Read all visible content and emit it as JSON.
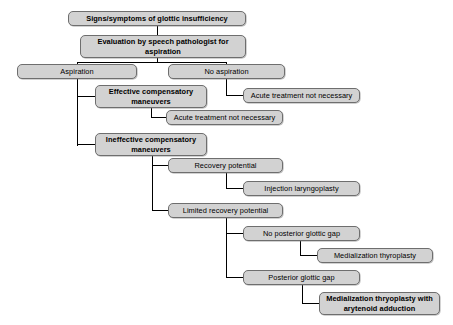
{
  "diagram": {
    "type": "flowchart",
    "background_color": "#ffffff",
    "node_fill_color": "#d2d2d2",
    "node_border_color": "#6e6e6e",
    "connector_color": "#000000",
    "nodes": [
      {
        "id": "signs",
        "label": "Signs/symptoms of glottic insufficiency",
        "bold": true,
        "x": 68,
        "y": 11,
        "w": 178,
        "h": 15
      },
      {
        "id": "evaluation",
        "label": "Evaluation by speech pathologist for aspiration",
        "bold": true,
        "x": 80,
        "y": 35,
        "w": 166,
        "h": 23
      },
      {
        "id": "aspiration",
        "label": "Aspiration",
        "bold": false,
        "x": 17,
        "y": 64,
        "w": 120,
        "h": 15
      },
      {
        "id": "noaspiration",
        "label": "No aspiration",
        "bold": false,
        "x": 168,
        "y": 64,
        "w": 117,
        "h": 15
      },
      {
        "id": "acute1",
        "label": "Acute treatment not necessary",
        "bold": false,
        "x": 243,
        "y": 88,
        "w": 117,
        "h": 15
      },
      {
        "id": "effective",
        "label": "Effective compensatory maneuvers",
        "bold": true,
        "x": 95,
        "y": 85,
        "w": 112,
        "h": 23
      },
      {
        "id": "acute2",
        "label": "Acute treatment not necessary",
        "bold": false,
        "x": 166,
        "y": 110,
        "w": 117,
        "h": 15
      },
      {
        "id": "ineffective",
        "label": "Ineffective compensatory maneuvers",
        "bold": true,
        "x": 95,
        "y": 133,
        "w": 112,
        "h": 23
      },
      {
        "id": "recovery",
        "label": "Recovery potential",
        "bold": false,
        "x": 168,
        "y": 158,
        "w": 115,
        "h": 15
      },
      {
        "id": "injection",
        "label": "Injection laryngoplasty",
        "bold": false,
        "x": 243,
        "y": 181,
        "w": 117,
        "h": 15
      },
      {
        "id": "limited",
        "label": "Limited recovery potential",
        "bold": false,
        "x": 168,
        "y": 203,
        "w": 115,
        "h": 15
      },
      {
        "id": "noposterior",
        "label": "No posterior glottic gap",
        "bold": false,
        "x": 243,
        "y": 226,
        "w": 117,
        "h": 15
      },
      {
        "id": "medthyro",
        "label": "Medialization thyroplasty",
        "bold": false,
        "x": 317,
        "y": 248,
        "w": 116,
        "h": 15
      },
      {
        "id": "posterior",
        "label": "Posterior glottic gap",
        "bold": false,
        "x": 243,
        "y": 270,
        "w": 117,
        "h": 15
      },
      {
        "id": "medthyroaryt",
        "label": "Medialization thryoplasty with arytenoid adduction",
        "bold": true,
        "x": 319,
        "y": 292,
        "w": 121,
        "h": 23
      }
    ],
    "connectors": [
      {
        "from": "signs",
        "to": "evaluation",
        "style": "vertical"
      },
      {
        "from": "evaluation",
        "to": "aspiration",
        "style": "split-left"
      },
      {
        "from": "evaluation",
        "to": "noaspiration",
        "style": "split-right"
      },
      {
        "from": "noaspiration",
        "to": "acute1",
        "style": "elbow"
      },
      {
        "from": "aspiration",
        "to": "effective",
        "style": "elbow"
      },
      {
        "from": "aspiration",
        "to": "ineffective",
        "style": "elbow"
      },
      {
        "from": "effective",
        "to": "acute2",
        "style": "elbow"
      },
      {
        "from": "ineffective",
        "to": "recovery",
        "style": "elbow"
      },
      {
        "from": "ineffective",
        "to": "limited",
        "style": "elbow"
      },
      {
        "from": "recovery",
        "to": "injection",
        "style": "elbow"
      },
      {
        "from": "limited",
        "to": "noposterior",
        "style": "elbow"
      },
      {
        "from": "limited",
        "to": "posterior",
        "style": "elbow"
      },
      {
        "from": "noposterior",
        "to": "medthyro",
        "style": "elbow"
      },
      {
        "from": "posterior",
        "to": "medthyroaryt",
        "style": "elbow"
      }
    ],
    "edge_segments": [
      {
        "name": "signs-to-evaluation",
        "orient": "v",
        "x": 157,
        "y": 26,
        "len": 9
      },
      {
        "name": "evaluation-down-stub",
        "orient": "v",
        "x": 157,
        "y": 58,
        "len": 5
      },
      {
        "name": "evaluation-split-bar",
        "orient": "h",
        "x": 77,
        "y": 62,
        "len": 150
      },
      {
        "name": "split-drop-aspiration",
        "orient": "v",
        "x": 77,
        "y": 62,
        "len": 3
      },
      {
        "name": "split-drop-noaspiration",
        "orient": "v",
        "x": 226,
        "y": 62,
        "len": 3
      },
      {
        "name": "noaspiration-spine",
        "orient": "v",
        "x": 226,
        "y": 79,
        "len": 17
      },
      {
        "name": "noaspiration-to-acute1",
        "orient": "h",
        "x": 226,
        "y": 95,
        "len": 18
      },
      {
        "name": "aspiration-spine",
        "orient": "v",
        "x": 77,
        "y": 79,
        "len": 67
      },
      {
        "name": "aspiration-to-effective",
        "orient": "h",
        "x": 77,
        "y": 96,
        "len": 19
      },
      {
        "name": "aspiration-to-ineffective",
        "orient": "h",
        "x": 77,
        "y": 144,
        "len": 19
      },
      {
        "name": "effective-spine",
        "orient": "v",
        "x": 151,
        "y": 108,
        "len": 10
      },
      {
        "name": "effective-to-acute2",
        "orient": "h",
        "x": 151,
        "y": 117,
        "len": 16
      },
      {
        "name": "ineffective-spine",
        "orient": "v",
        "x": 152,
        "y": 156,
        "len": 55
      },
      {
        "name": "ineffective-to-recovery",
        "orient": "h",
        "x": 152,
        "y": 165,
        "len": 17
      },
      {
        "name": "ineffective-to-limited",
        "orient": "h",
        "x": 152,
        "y": 210,
        "len": 17
      },
      {
        "name": "recovery-spine",
        "orient": "v",
        "x": 226,
        "y": 173,
        "len": 16
      },
      {
        "name": "recovery-to-injection",
        "orient": "h",
        "x": 226,
        "y": 188,
        "len": 18
      },
      {
        "name": "limited-spine",
        "orient": "v",
        "x": 226,
        "y": 218,
        "len": 60
      },
      {
        "name": "limited-to-noposterior",
        "orient": "h",
        "x": 226,
        "y": 233,
        "len": 18
      },
      {
        "name": "limited-to-posterior",
        "orient": "h",
        "x": 226,
        "y": 277,
        "len": 18
      },
      {
        "name": "noposterior-spine",
        "orient": "v",
        "x": 300,
        "y": 241,
        "len": 15
      },
      {
        "name": "noposterior-to-medthyro",
        "orient": "h",
        "x": 300,
        "y": 255,
        "len": 18
      },
      {
        "name": "posterior-spine",
        "orient": "v",
        "x": 302,
        "y": 285,
        "len": 19
      },
      {
        "name": "posterior-to-medthyroaryt",
        "orient": "h",
        "x": 302,
        "y": 303,
        "len": 18
      }
    ]
  }
}
